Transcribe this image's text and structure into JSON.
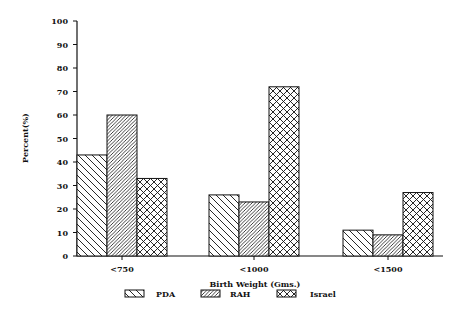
{
  "chart_data": {
    "type": "bar",
    "title": "",
    "xlabel": "Birth Weight (Gms.)",
    "ylabel": "Percent(%)",
    "ylim": [
      0,
      100
    ],
    "yticks": [
      0,
      10,
      20,
      30,
      40,
      50,
      60,
      70,
      80,
      90,
      100
    ],
    "categories": [
      "<750",
      "<1000",
      "<1500"
    ],
    "series": [
      {
        "name": "PDA",
        "pattern": "diagonal-backslash",
        "values": [
          43,
          26,
          11
        ]
      },
      {
        "name": "RAH",
        "pattern": "diagonal-dense-slash",
        "values": [
          60,
          23,
          9
        ]
      },
      {
        "name": "Israel",
        "pattern": "crosshatch",
        "values": [
          33,
          72,
          27
        ]
      }
    ],
    "grid": false,
    "legend_position": "bottom"
  },
  "colors": {
    "ink": "#111111",
    "background": "#ffffff"
  }
}
